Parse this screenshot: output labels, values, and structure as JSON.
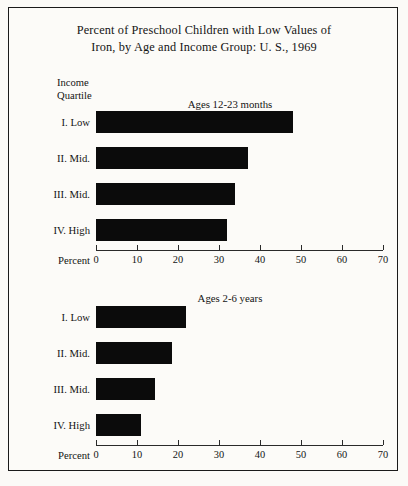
{
  "figure": {
    "title_line1": "Percent of Preschool Children with Low Values of",
    "title_line2": "Iron, by Age and Income Group: U. S., 1969",
    "quartile_header_line1": "Income",
    "quartile_header_line2": "Quartile",
    "axis_label": "Percent"
  },
  "chart_data": [
    {
      "type": "bar",
      "orientation": "horizontal",
      "title": "Ages 12-23 months",
      "xlabel": "Percent",
      "ylabel": "Income Quartile",
      "categories": [
        "I. Low",
        "II. Mid.",
        "III. Mid.",
        "IV. High"
      ],
      "values": [
        48,
        37,
        34,
        32
      ],
      "xlim": [
        0,
        70
      ],
      "xticks": [
        0,
        10,
        20,
        30,
        40,
        50,
        60,
        70
      ],
      "xticklabels": [
        "0",
        "10",
        "20",
        "30",
        "40",
        "50",
        "60",
        "70"
      ],
      "grid": false,
      "legend": false,
      "bar_color": "#0b0b0b"
    },
    {
      "type": "bar",
      "orientation": "horizontal",
      "title": "Ages 2-6 years",
      "xlabel": "Percent",
      "ylabel": "Income Quartile",
      "categories": [
        "I. Low",
        "II. Mid.",
        "III. Mid.",
        "IV. High"
      ],
      "values": [
        22,
        18.5,
        14.5,
        11
      ],
      "xlim": [
        0,
        70
      ],
      "xticks": [
        0,
        10,
        20,
        30,
        40,
        50,
        60,
        70
      ],
      "xticklabels": [
        "0",
        "10",
        "20",
        "30",
        "40",
        "50",
        "60",
        "70"
      ],
      "grid": false,
      "legend": false,
      "bar_color": "#0b0b0b"
    }
  ]
}
